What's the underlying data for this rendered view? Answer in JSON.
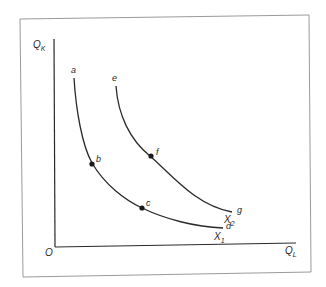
{
  "diagram": {
    "type": "isoquant-map",
    "axes": {
      "y_label": "Q",
      "y_sub": "K",
      "x_label": "Q",
      "x_sub": "L",
      "origin_label": "O"
    },
    "curves": [
      {
        "name": "X",
        "sub": "1",
        "endpoints": {
          "start": "a",
          "end": "d"
        },
        "points": [
          {
            "label": "b"
          },
          {
            "label": "c"
          }
        ]
      },
      {
        "name": "X",
        "sub": "2",
        "endpoints": {
          "start": "e",
          "end": "g"
        },
        "points": [
          {
            "label": "f"
          }
        ]
      }
    ]
  }
}
